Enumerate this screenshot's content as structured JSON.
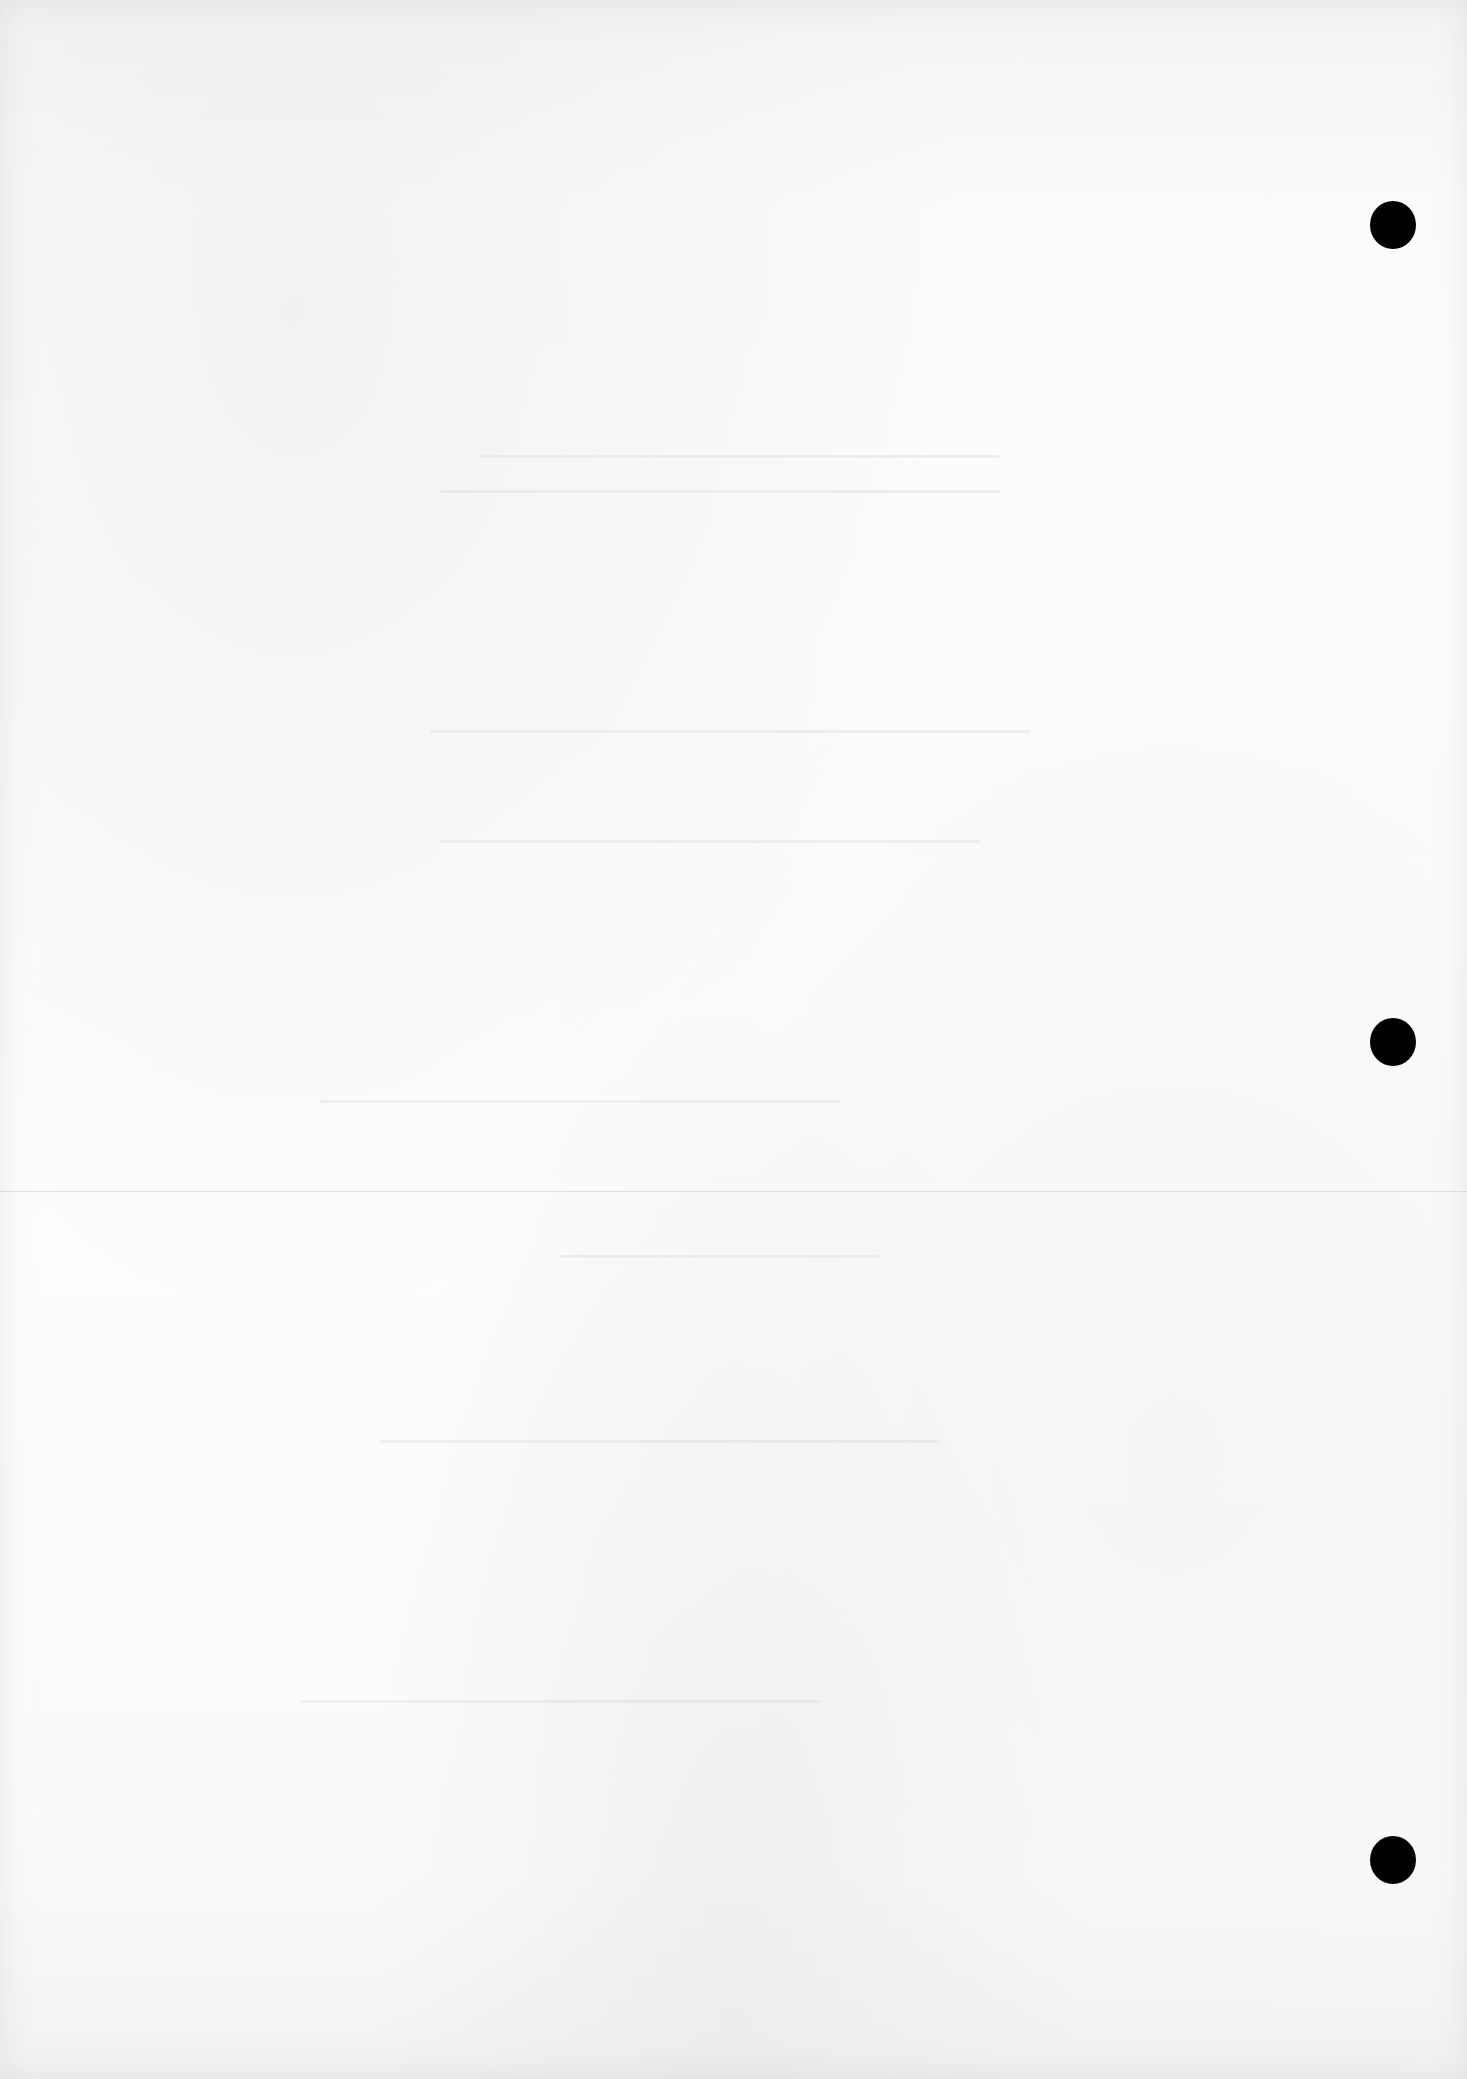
{
  "page": {
    "type": "blank-scanned-sheet",
    "text_content": [],
    "background_color": "#fdfdfd",
    "fold_line": {
      "y": 1191,
      "color": "#c8c8c8"
    },
    "punch_holes": [
      {
        "x": 1370,
        "y": 201,
        "w": 46,
        "h": 48,
        "color": "#000000"
      },
      {
        "x": 1370,
        "y": 1018,
        "w": 46,
        "h": 48,
        "color": "#000000"
      },
      {
        "x": 1370,
        "y": 1836,
        "w": 46,
        "h": 48,
        "color": "#000000"
      }
    ]
  }
}
